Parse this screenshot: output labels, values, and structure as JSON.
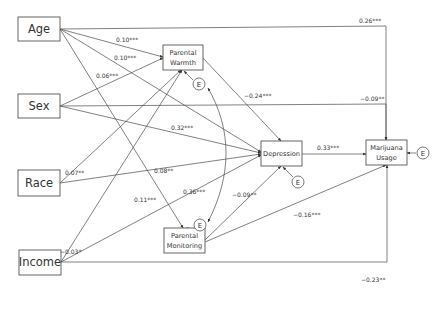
{
  "diagram": {
    "type": "path_model",
    "nodes": {
      "age": {
        "label": "Age"
      },
      "sex": {
        "label": "Sex"
      },
      "race": {
        "label": "Race"
      },
      "income": {
        "label": "Income"
      },
      "warmth": {
        "line1": "Parental",
        "line2": "Warmth"
      },
      "monitoring": {
        "line1": "Parental",
        "line2": "Monitoring"
      },
      "depression": {
        "label": "Depression"
      },
      "marijuana": {
        "line1": "Marijuana",
        "line2": "Usage"
      }
    },
    "error_label": "E",
    "paths": {
      "age_warmth": "0.10***",
      "age_depression": "0.10***",
      "sex_warmth": "0.06***",
      "age_marijuana": "0.26***",
      "warmth_depression": "−0.24***",
      "sex_marijuana": "−0.09**",
      "sex_depression": "0.32***",
      "race_warmth": "0.07**",
      "race_depression": "0.08**",
      "income_depression": "0.36***",
      "age_monitoring": "0.11***",
      "depression_marijuana": "0.33***",
      "monitoring_depression": "−0.09**",
      "monitoring_marijuana": "−0.16***",
      "income_warmth": "−0.03*",
      "income_marijuana": "−0.23**"
    }
  }
}
